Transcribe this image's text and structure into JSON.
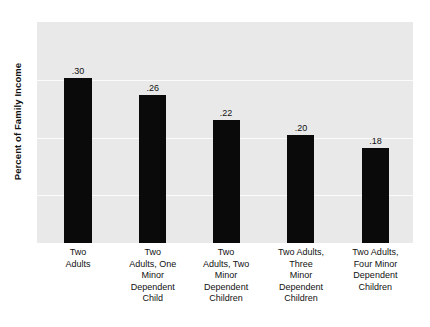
{
  "chart_data": {
    "type": "bar",
    "title": "",
    "subtitle": "",
    "xlabel": "",
    "ylabel": "Percent of Family Income",
    "categories": [
      "Two Adults",
      "Two Adults, One Minor Dependent Child",
      "Two Adults, Two Minor Dependent Children",
      "Two Adults, Three Minor Dependent Children",
      "Two Adults, Four Minor Dependent Children"
    ],
    "category_lines": [
      [
        "Two",
        "Adults"
      ],
      [
        "Two",
        "Adults, One",
        "Minor",
        "Dependent",
        "Child"
      ],
      [
        "Two",
        "Adults, Two",
        "Minor",
        "Dependent",
        "Children"
      ],
      [
        "Two Adults,",
        "Three",
        "Minor",
        "Dependent",
        "Children"
      ],
      [
        "Two Adults,",
        "Four Minor",
        "Dependent",
        "Children"
      ]
    ],
    "values": [
      0.3,
      0.26,
      0.22,
      0.2,
      0.18
    ],
    "value_labels": [
      ".30",
      ".26",
      ".22",
      ".20",
      ".18"
    ],
    "ylim": [
      0,
      0.44
    ],
    "grid": true,
    "gridlines_y": [
      0.115,
      0.19,
      0.265
    ],
    "legend": "none",
    "bar_color": "#0a0a0a",
    "plot_background": "#e9e9e9",
    "gridline_color": "#fbfbfb",
    "page_background": "#ffffff",
    "text_color": "#111111"
  },
  "bars": [
    {
      "value_label": ".30",
      "lines": [
        "Two",
        "Adults"
      ],
      "center_pct": 10.9,
      "width_pct": 7.2,
      "height_pct": 74.7
    },
    {
      "value_label": ".26",
      "lines": [
        "Two",
        "Adults, One",
        "Minor",
        "Dependent",
        "Child"
      ],
      "center_pct": 30.8,
      "width_pct": 7.2,
      "height_pct": 67.0
    },
    {
      "value_label": ".22",
      "lines": [
        "Two",
        "Adults, Two",
        "Minor",
        "Dependent",
        "Children"
      ],
      "center_pct": 50.3,
      "width_pct": 7.2,
      "height_pct": 55.7
    },
    {
      "value_label": ".20",
      "lines": [
        "Two Adults,",
        "Three",
        "Minor",
        "Dependent",
        "Children"
      ],
      "center_pct": 70.2,
      "width_pct": 7.2,
      "height_pct": 48.9
    },
    {
      "value_label": ".18",
      "lines": [
        "Two Adults,",
        "Four Minor",
        "Dependent",
        "Children"
      ],
      "center_pct": 90.0,
      "width_pct": 7.2,
      "height_pct": 43.0
    }
  ],
  "gridlines": [
    {
      "top_pct": 26.2
    },
    {
      "top_pct": 52.5
    },
    {
      "top_pct": 78.3
    }
  ]
}
